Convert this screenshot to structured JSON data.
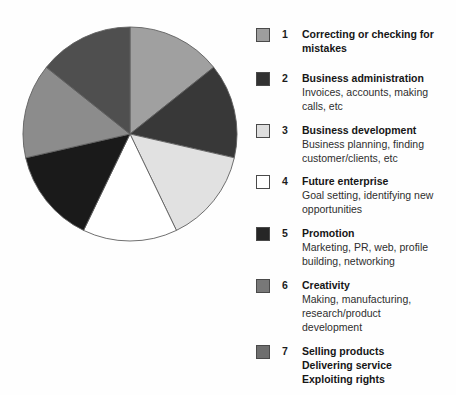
{
  "figure": {
    "background": "#fefefe",
    "swatch_border_color": "#4a4a4a"
  },
  "chart_data": {
    "type": "pie",
    "title": "",
    "start_angle_deg": 0,
    "direction": "clockwise",
    "legend_position": "right",
    "stroke_color": "#606060",
    "slices": [
      {
        "id": 1,
        "label": "Correcting or checking for mistakes",
        "value": 1,
        "fraction_pct": 14.3,
        "color": "#a0a0a0"
      },
      {
        "id": 2,
        "label": "Business administration",
        "value": 1,
        "fraction_pct": 14.3,
        "color": "#383838"
      },
      {
        "id": 3,
        "label": "Business development",
        "value": 1,
        "fraction_pct": 14.3,
        "color": "#e1e1e1"
      },
      {
        "id": 4,
        "label": "Future enterprise",
        "value": 1,
        "fraction_pct": 14.3,
        "color": "#ffffff"
      },
      {
        "id": 5,
        "label": "Promotion",
        "value": 1,
        "fraction_pct": 14.3,
        "color": "#1a1a1a"
      },
      {
        "id": 6,
        "label": "Creativity",
        "value": 1,
        "fraction_pct": 14.3,
        "color": "#8c8c8c"
      },
      {
        "id": 7,
        "label": "Selling products / Delivering service / Exploiting rights",
        "value": 1,
        "fraction_pct": 14.3,
        "color": "#4f4f4f"
      }
    ]
  },
  "legend": {
    "items": [
      {
        "number": "1",
        "title": "Correcting or checking for\nmistakes",
        "description": "",
        "color": "#9e9e9e"
      },
      {
        "number": "2",
        "title": "Business administration",
        "description": "Invoices, accounts, making\ncalls, etc",
        "color": "#323232"
      },
      {
        "number": "3",
        "title": "Business development",
        "description": "Business planning, finding\ncustomer/clients, etc",
        "color": "#dedede"
      },
      {
        "number": "4",
        "title": "Future enterprise",
        "description": "Goal setting, identifying new\nopportunities",
        "color": "#ffffff"
      },
      {
        "number": "5",
        "title": "Promotion",
        "description": "Marketing, PR, web, profile\nbuilding, networking",
        "color": "#262626"
      },
      {
        "number": "6",
        "title": "Creativity",
        "description": "Making, manufacturing,\nresearch/product\ndevelopment",
        "color": "#787878"
      },
      {
        "number": "7",
        "title": "Selling products\nDelivering service\nExploiting rights",
        "description": "",
        "color": "#6e6e6e"
      }
    ]
  }
}
